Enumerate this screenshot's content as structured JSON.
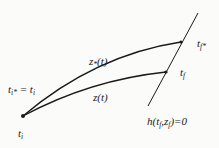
{
  "diagram": {
    "type": "trajectory-terminal-surface",
    "colors": {
      "stroke": "#1a1a1a",
      "background": "#fbfbf9"
    },
    "nodes": [
      {
        "id": "start",
        "label_main": "t",
        "label_sub": "i",
        "x": 23,
        "y": 116
      },
      {
        "id": "end_star",
        "label_main": "t",
        "label_sub": "f*",
        "x": 181,
        "y": 42
      },
      {
        "id": "end",
        "label_main": "t",
        "label_sub": "f",
        "x": 166,
        "y": 72
      }
    ],
    "curves": [
      {
        "id": "z_star",
        "label": "z*(t)",
        "from": "start",
        "to": "end_star"
      },
      {
        "id": "z",
        "label": "z(t)",
        "from": "start",
        "to": "end"
      }
    ],
    "surface": {
      "label": "h(tf,zf)=0",
      "from": [
        198,
        13
      ],
      "to": [
        148,
        106
      ]
    },
    "labels": {
      "start_eq": {
        "a": "t",
        "a_sub": "i*",
        "eq": " = ",
        "b": "t",
        "b_sub": "i"
      },
      "start_below": {
        "main": "t",
        "sub": "i"
      },
      "z_star": {
        "main": "z",
        "sub": "*",
        "arg": "(t)"
      },
      "z": {
        "text": "z(t)"
      },
      "tf_star": {
        "main": "t",
        "sub": "f*"
      },
      "tf": {
        "main": "t",
        "sub": "f"
      },
      "surface": {
        "pre": "h(t",
        "s1": "f",
        "mid": ",z",
        "s2": "f",
        "post": ")=0"
      }
    }
  }
}
